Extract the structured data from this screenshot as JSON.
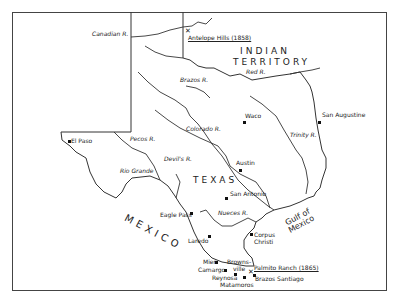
{
  "map": {
    "regions": {
      "indian_territory": [
        "INDIAN",
        "TERRITORY"
      ],
      "texas": "TEXAS",
      "mexico": "MEXICO",
      "gulf": [
        "Gulf of",
        "Mexico"
      ]
    },
    "rivers": {
      "canadian": "Canadian R.",
      "red": "Red R.",
      "brazos": "Brazos R.",
      "colorado": "Colorado R.",
      "trinity": "Trinity R.",
      "pecos": "Pecos R.",
      "devils": "Devil's R.",
      "rio_grande": "Rio Grande",
      "nueces": "Nueces R."
    },
    "places": {
      "antelope_hills": "Antelope Hills (1858)",
      "san_augustine": "San Augustine",
      "waco": "Waco",
      "austin": "Austin",
      "el_paso": "El Paso",
      "san_antonio": "San Antonio",
      "eagle_pass": "Eagle Pass",
      "laredo": "Laredo",
      "corpus_christi": [
        "Corpus",
        "Christi"
      ],
      "mier": "Mier",
      "camargo": "Camargo",
      "brownsville": [
        "Browns-",
        "ville"
      ],
      "reynosa": "Reynosa",
      "matamoros": "Matamoros",
      "palmito_ranch": "Palmito Ranch (1865)",
      "brazos_santiago": "Brazos Santiago"
    }
  }
}
